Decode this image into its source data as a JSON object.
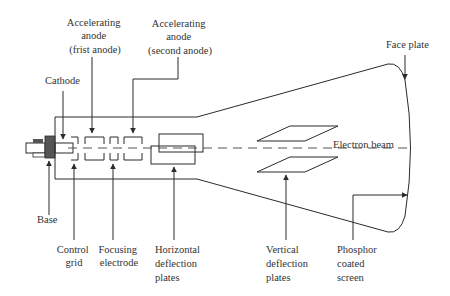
{
  "diagram": {
    "colors": {
      "line": "#2b2b2b",
      "text": "#333333",
      "base": "#555555",
      "background": "#ffffff"
    },
    "labels": {
      "accel_first": [
        "Accelerating",
        "anode",
        "(frist anode)"
      ],
      "accel_second": [
        "Accelerating",
        "anode",
        "(second anode)"
      ],
      "cathode": "Cathode",
      "face_plate": "Face plate",
      "electron_beam": "Electron beam",
      "base": "Base",
      "control_grid": [
        "Control",
        "grid"
      ],
      "focusing_electrode": [
        "Focusing",
        "electrode"
      ],
      "horizontal_plates": [
        "Horizontal",
        "deflection",
        "plates"
      ],
      "vertical_plates": [
        "Vertical",
        "deflection",
        "plates"
      ],
      "phosphor_screen": [
        "Phosphor",
        "coated",
        "screen"
      ]
    }
  }
}
